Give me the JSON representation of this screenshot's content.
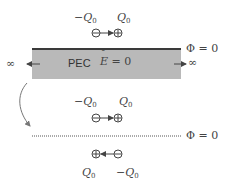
{
  "diagram": {
    "top_dipole": {
      "neg_label": "−Q",
      "neg_sub": "0",
      "pos_label": "Q",
      "pos_sub": "0",
      "direction": "neg-to-pos (right)"
    },
    "pec_region": {
      "label": "PEC",
      "field_label": "E",
      "field_eq": "= 0",
      "boundary_label": "Φ = 0",
      "left_infinity": "∞",
      "right_infinity": "∞",
      "fill_color": "#b9b9b9",
      "edge_color": "#3a3a3a"
    },
    "equivalent_dipole": {
      "neg_label": "−Q",
      "neg_sub": "0",
      "pos_label": "Q",
      "pos_sub": "0",
      "direction": "neg-to-pos (right)"
    },
    "ground_plane": {
      "style": "dotted",
      "boundary_label": "Φ = 0"
    },
    "image_dipole": {
      "pos_label": "Q",
      "pos_sub": "0",
      "neg_label": "−Q",
      "neg_sub": "0",
      "direction": "neg-to-pos (left)"
    },
    "transform_arrow": "curved arrow from PEC setup to image-method setup"
  }
}
